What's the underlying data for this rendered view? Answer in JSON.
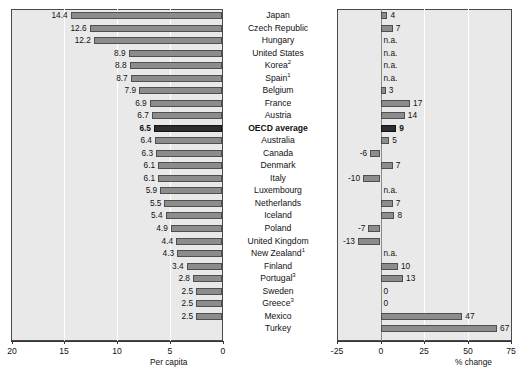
{
  "chart_data": {
    "type": "bar",
    "title": "",
    "panels": [
      {
        "id": "per-capita",
        "xlabel": "Per capita",
        "xlim": [
          20,
          0
        ],
        "reversed": true,
        "ticks": [
          "20",
          "15",
          "10",
          "5",
          "0"
        ],
        "tick_values": [
          20,
          15,
          10,
          5,
          0
        ],
        "grid": true,
        "values": [
          14.4,
          12.6,
          12.2,
          8.9,
          8.8,
          8.7,
          7.9,
          6.9,
          6.7,
          6.5,
          6.4,
          6.3,
          6.1,
          6.1,
          5.9,
          5.5,
          5.4,
          4.9,
          4.4,
          4.3,
          3.4,
          2.8,
          2.5,
          2.5,
          2.5
        ],
        "labels": [
          "14.4",
          "12.6",
          "12.2",
          "8.9",
          "8.8",
          "8.7",
          "7.9",
          "6.9",
          "6.7",
          "6.5",
          "6.4",
          "6.3",
          "6.1",
          "6.1",
          "5.9",
          "5.5",
          "5.4",
          "4.9",
          "4.4",
          "4.3",
          "3.4",
          "2.8",
          "2.5",
          "2.5",
          "2.5"
        ]
      },
      {
        "id": "pct-change",
        "xlabel": "% change",
        "xlim": [
          -25,
          75
        ],
        "reversed": false,
        "ticks": [
          "-25",
          "0",
          "25",
          "50",
          "75"
        ],
        "tick_values": [
          -25,
          0,
          25,
          50,
          75
        ],
        "grid": true,
        "values": [
          4,
          7,
          null,
          null,
          null,
          null,
          3,
          17,
          14,
          9,
          5,
          -6,
          7,
          -10,
          null,
          7,
          8,
          -7,
          -13,
          null,
          10,
          13,
          0,
          0,
          47,
          67
        ],
        "labels": [
          "4",
          "7",
          "n.a.",
          "n.a.",
          "n.a.",
          "n.a.",
          "3",
          "17",
          "14",
          "9",
          "5",
          "-6",
          "7",
          "-10",
          "n.a.",
          "7",
          "8",
          "-7",
          "-13",
          "n.a.",
          "10",
          "13",
          "0",
          "0",
          "47",
          "67"
        ]
      }
    ],
    "categories": [
      "Japan",
      "Czech Republic",
      "Hungary",
      "United States",
      "Korea",
      "Spain",
      "Belgium",
      "France",
      "Austria",
      "OECD average",
      "Australia",
      "Canada",
      "Denmark",
      "Italy",
      "Luxembourg",
      "Netherlands",
      "Iceland",
      "Poland",
      "United Kingdom",
      "New Zealand",
      "Finland",
      "Portugal",
      "Sweden",
      "Greece",
      "Mexico",
      "Turkey"
    ],
    "category_superscripts": [
      "",
      "",
      "",
      "",
      "2",
      "1",
      "",
      "",
      "",
      "",
      "",
      "",
      "",
      "",
      "",
      "",
      "",
      "",
      "",
      "1",
      "",
      "3",
      "",
      "3",
      "",
      ""
    ],
    "highlight_index": 9,
    "rows": [
      {
        "name": "Japan",
        "sup": "",
        "per_capita": 14.4,
        "per_capita_label": "14.4",
        "pct_change": 4,
        "pct_change_label": "4"
      },
      {
        "name": "Czech Republic",
        "sup": "",
        "per_capita": 12.6,
        "per_capita_label": "12.6",
        "pct_change": 7,
        "pct_change_label": "7"
      },
      {
        "name": "Hungary",
        "sup": "",
        "per_capita": 12.2,
        "per_capita_label": "12.2",
        "pct_change": null,
        "pct_change_label": "n.a."
      },
      {
        "name": "United States",
        "sup": "",
        "per_capita": 8.9,
        "per_capita_label": "8.9",
        "pct_change": null,
        "pct_change_label": "n.a."
      },
      {
        "name": "Korea",
        "sup": "2",
        "per_capita": 8.8,
        "per_capita_label": "8.8",
        "pct_change": null,
        "pct_change_label": "n.a."
      },
      {
        "name": "Spain",
        "sup": "1",
        "per_capita": 8.7,
        "per_capita_label": "8.7",
        "pct_change": null,
        "pct_change_label": "n.a."
      },
      {
        "name": "Belgium",
        "sup": "",
        "per_capita": 7.9,
        "per_capita_label": "7.9",
        "pct_change": 3,
        "pct_change_label": "3"
      },
      {
        "name": "France",
        "sup": "",
        "per_capita": 6.9,
        "per_capita_label": "6.9",
        "pct_change": 17,
        "pct_change_label": "17"
      },
      {
        "name": "Austria",
        "sup": "",
        "per_capita": 6.7,
        "per_capita_label": "6.7",
        "pct_change": 14,
        "pct_change_label": "14"
      },
      {
        "name": "OECD average",
        "sup": "",
        "per_capita": 6.5,
        "per_capita_label": "6.5",
        "pct_change": 9,
        "pct_change_label": "9"
      },
      {
        "name": "Australia",
        "sup": "",
        "per_capita": 6.4,
        "per_capita_label": "6.4",
        "pct_change": 5,
        "pct_change_label": "5"
      },
      {
        "name": "Canada",
        "sup": "",
        "per_capita": 6.3,
        "per_capita_label": "6.3",
        "pct_change": -6,
        "pct_change_label": "-6"
      },
      {
        "name": "Denmark",
        "sup": "",
        "per_capita": 6.1,
        "per_capita_label": "6.1",
        "pct_change": 7,
        "pct_change_label": "7"
      },
      {
        "name": "Italy",
        "sup": "",
        "per_capita": 6.1,
        "per_capita_label": "6.1",
        "pct_change": -10,
        "pct_change_label": "-10"
      },
      {
        "name": "Luxembourg",
        "sup": "",
        "per_capita": 5.9,
        "per_capita_label": "5.9",
        "pct_change": null,
        "pct_change_label": "n.a."
      },
      {
        "name": "Netherlands",
        "sup": "",
        "per_capita": 5.5,
        "per_capita_label": "5.5",
        "pct_change": 7,
        "pct_change_label": "7"
      },
      {
        "name": "Iceland",
        "sup": "",
        "per_capita": 5.4,
        "per_capita_label": "5.4",
        "pct_change": 8,
        "pct_change_label": "8"
      },
      {
        "name": "Poland",
        "sup": "",
        "per_capita": 4.9,
        "per_capita_label": "4.9",
        "pct_change": -7,
        "pct_change_label": "-7"
      },
      {
        "name": "United Kingdom",
        "sup": "",
        "per_capita": 4.4,
        "per_capita_label": "4.4",
        "pct_change": -13,
        "pct_change_label": "-13"
      },
      {
        "name": "New Zealand",
        "sup": "1",
        "per_capita": 4.3,
        "per_capita_label": "4.3",
        "pct_change": null,
        "pct_change_label": "n.a."
      },
      {
        "name": "Finland",
        "sup": "",
        "per_capita": 3.4,
        "per_capita_label": "3.4",
        "pct_change": 10,
        "pct_change_label": "10"
      },
      {
        "name": "Portugal",
        "sup": "3",
        "per_capita": 2.8,
        "per_capita_label": "2.8",
        "pct_change": 13,
        "pct_change_label": "13"
      },
      {
        "name": "Sweden",
        "sup": "",
        "per_capita": 2.5,
        "per_capita_label": "2.5",
        "pct_change": 0,
        "pct_change_label": "0"
      },
      {
        "name": "Greece",
        "sup": "3",
        "per_capita": 2.5,
        "per_capita_label": "2.5",
        "pct_change": 0,
        "pct_change_label": "0"
      },
      {
        "name": "Mexico",
        "sup": "",
        "per_capita": 2.5,
        "per_capita_label": "2.5",
        "pct_change": 47,
        "pct_change_label": "47"
      },
      {
        "name": "Turkey",
        "sup": "",
        "per_capita": null,
        "per_capita_label": "",
        "pct_change": 67,
        "pct_change_label": "67"
      }
    ],
    "colors": {
      "bar": "#8c8c8c",
      "bar_border": "#4f4f4f",
      "bar_highlight": "#2e2e2e",
      "panel_background": "#e9e9e9",
      "gridline": "#ffffff",
      "axis": "#333333",
      "text": "#111111"
    }
  }
}
